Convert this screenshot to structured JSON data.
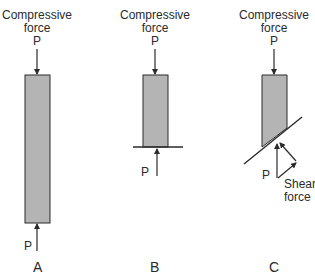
{
  "panels": [
    {
      "id": "A",
      "label": "A",
      "top_label_line1": "Compressive",
      "top_label_line2": "force",
      "top_force": "P",
      "bottom_force": "P"
    },
    {
      "id": "B",
      "label": "B",
      "top_label_line1": "Compressive",
      "top_label_line2": "force",
      "top_force": "P",
      "bottom_force": "P"
    },
    {
      "id": "C",
      "label": "C",
      "top_label_line1": "Compressive",
      "top_label_line2": "force",
      "top_force": "P",
      "bottom_force": "P",
      "shear_label_line1": "Shear",
      "shear_label_line2": "force"
    }
  ],
  "colors": {
    "column_fill": "#b4b4b4",
    "stroke": "#2a2a2a",
    "text": "#2a2a2a"
  }
}
